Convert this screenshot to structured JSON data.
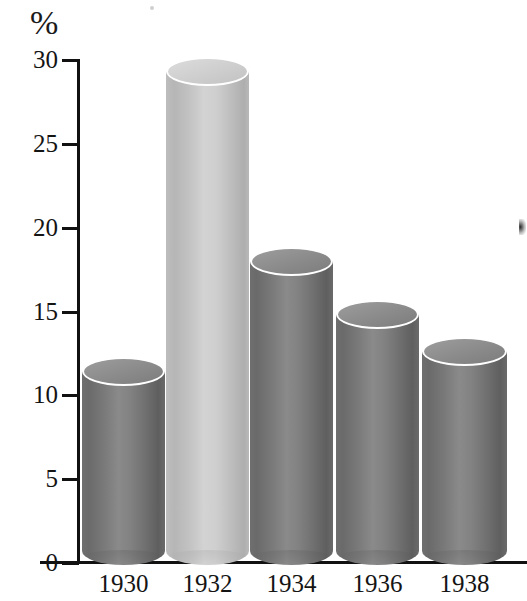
{
  "chart_data": {
    "type": "bar",
    "title": "",
    "subtitle": "",
    "xlabel": "",
    "ylabel": "%",
    "categories": [
      "1930",
      "1932",
      "1934",
      "1936",
      "1938"
    ],
    "values": [
      11.4,
      29.3,
      18.0,
      14.8,
      12.6
    ],
    "ylim": [
      0,
      30
    ],
    "yticks": [
      0,
      5,
      10,
      15,
      20,
      25,
      30
    ],
    "ytick_labels": [
      "0",
      "5",
      "10",
      "15",
      "20",
      "25",
      "30"
    ],
    "grid": false,
    "legend": false,
    "legend_position": "none",
    "style": "3d-cylinder",
    "bar_colors": [
      "#7a7a7a",
      "#c4c4c4",
      "#7a7a7a",
      "#7a7a7a",
      "#7a7a7a"
    ],
    "annotations": []
  },
  "axis": {
    "unit_label": "%",
    "axis_color": "#111111",
    "tick_labels": [
      {
        "value": 30,
        "label": "30"
      },
      {
        "value": 25,
        "label": "25"
      },
      {
        "value": 20,
        "label": "20"
      },
      {
        "value": 15,
        "label": "15"
      },
      {
        "value": 10,
        "label": "10"
      },
      {
        "value": 5,
        "label": "5"
      },
      {
        "value": 0,
        "label": "0"
      }
    ]
  },
  "bars": [
    {
      "label": "1930",
      "value": 11.4,
      "tone": "dark"
    },
    {
      "label": "1932",
      "value": 29.3,
      "tone": "light"
    },
    {
      "label": "1934",
      "value": 18.0,
      "tone": "dark"
    },
    {
      "label": "1936",
      "value": 14.8,
      "tone": "dark"
    },
    {
      "label": "1938",
      "value": 12.6,
      "tone": "dark"
    }
  ]
}
